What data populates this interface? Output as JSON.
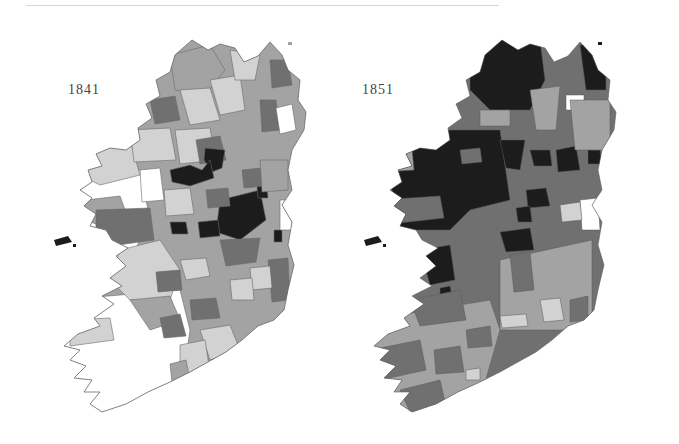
{
  "maps": [
    {
      "id": "1841",
      "label": "1841"
    },
    {
      "id": "1851",
      "label": "1851"
    }
  ],
  "legend_tones": {
    "none": "#ffffff",
    "low": "#d2d2d2",
    "mid": "#a3a3a3",
    "high": "#707070",
    "very_high": "#1c1c1c"
  },
  "border_color": "#6a6a6a"
}
